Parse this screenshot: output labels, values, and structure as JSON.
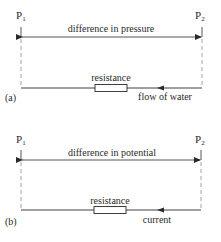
{
  "panels": [
    {
      "id": "a",
      "tag": "(a)",
      "left_point": {
        "label": "P",
        "sub": "1"
      },
      "right_point": {
        "label": "P",
        "sub": "2"
      },
      "span_label": "difference in pressure",
      "resistor_label": "resistance",
      "flow_label": "flow of water"
    },
    {
      "id": "b",
      "tag": "(b)",
      "left_point": {
        "label": "P",
        "sub": "1"
      },
      "right_point": {
        "label": "P",
        "sub": "2"
      },
      "span_label": "difference in potential",
      "resistor_label": "resistance",
      "flow_label": "current"
    }
  ],
  "colors": {
    "line": "#2a2a2a",
    "dash": "#8a8a8a",
    "background": "#ffffff"
  }
}
